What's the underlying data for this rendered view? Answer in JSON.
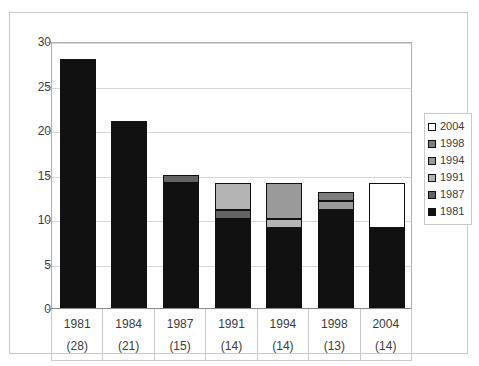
{
  "chart_data": {
    "type": "bar",
    "subtype": "stacked-column",
    "title": "",
    "xlabel": "",
    "ylabel": "",
    "ylim": [
      0,
      30
    ],
    "ytick_step": 5,
    "yticks": [
      0,
      5,
      10,
      15,
      20,
      25,
      30
    ],
    "grid": true,
    "legend_position": "right",
    "categories": [
      "1981",
      "1984",
      "1987",
      "1991",
      "1994",
      "1998",
      "2004"
    ],
    "category_counts": [
      "(28)",
      "(21)",
      "(15)",
      "(14)",
      "(14)",
      "(13)",
      "(14)"
    ],
    "totals": [
      28,
      21,
      15,
      14,
      14,
      13,
      14
    ],
    "series": [
      {
        "name": "1981",
        "color": "#111111",
        "values": [
          28,
          21,
          14,
          10,
          9,
          11,
          9
        ]
      },
      {
        "name": "1987",
        "color": "#636363",
        "values": [
          0,
          0,
          1,
          1,
          0,
          0,
          0
        ]
      },
      {
        "name": "1991",
        "color": "#b4b4b4",
        "values": [
          0,
          0,
          0,
          3,
          1,
          0,
          0
        ]
      },
      {
        "name": "1994",
        "color": "#9a9a9a",
        "values": [
          0,
          0,
          0,
          0,
          4,
          1,
          0
        ]
      },
      {
        "name": "1998",
        "color": "#7d7d7d",
        "values": [
          0,
          0,
          0,
          0,
          0,
          1,
          0
        ]
      },
      {
        "name": "2004",
        "color": "#ffffff",
        "values": [
          0,
          0,
          0,
          0,
          0,
          0,
          5
        ]
      }
    ],
    "legend": [
      {
        "label": "2004",
        "color": "#ffffff"
      },
      {
        "label": "1998",
        "color": "#7d7d7d"
      },
      {
        "label": "1994",
        "color": "#9a9a9a"
      },
      {
        "label": "1991",
        "color": "#b4b4b4"
      },
      {
        "label": "1987",
        "color": "#636363"
      },
      {
        "label": "1981",
        "color": "#111111"
      }
    ]
  },
  "colors": {
    "frame_border": "#c9c9c9",
    "axis": "#8a8a8a",
    "gridline": "#d8d8d8",
    "text": "#3c3c3c",
    "plot_background": "#ffffff"
  }
}
